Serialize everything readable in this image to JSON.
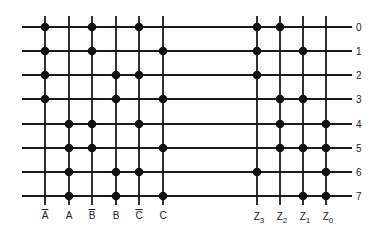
{
  "diagram": {
    "title": "",
    "row_labels": [
      "0",
      "1",
      "2",
      "3",
      "4",
      "5",
      "6",
      "7"
    ],
    "input_columns": [
      {
        "label": "A",
        "complement": true
      },
      {
        "label": "A",
        "complement": false
      },
      {
        "label": "B",
        "complement": true
      },
      {
        "label": "B",
        "complement": false
      },
      {
        "label": "C",
        "complement": true
      },
      {
        "label": "C",
        "complement": false
      }
    ],
    "output_columns": [
      {
        "label": "Z",
        "sub": "3"
      },
      {
        "label": "Z",
        "sub": "2"
      },
      {
        "label": "Z",
        "sub": "1"
      },
      {
        "label": "Z",
        "sub": "0"
      }
    ],
    "connections": {
      "0": {
        "inputs": [
          "A̅",
          "B̅",
          "C̅"
        ],
        "outputs": [
          "Z3",
          "Z2"
        ]
      },
      "1": {
        "inputs": [
          "A̅",
          "B̅",
          "C"
        ],
        "outputs": [
          "Z3",
          "Z1"
        ]
      },
      "2": {
        "inputs": [
          "A̅",
          "B",
          "C̅"
        ],
        "outputs": [
          "Z3"
        ]
      },
      "3": {
        "inputs": [
          "A̅",
          "B",
          "C"
        ],
        "outputs": [
          "Z2",
          "Z1"
        ]
      },
      "4": {
        "inputs": [
          "A",
          "B̅",
          "C̅"
        ],
        "outputs": [
          "Z2",
          "Z0"
        ]
      },
      "5": {
        "inputs": [
          "A",
          "B̅",
          "C"
        ],
        "outputs": [
          "Z2",
          "Z1",
          "Z0"
        ]
      },
      "6": {
        "inputs": [
          "A",
          "B",
          "C̅"
        ],
        "outputs": [
          "Z3",
          "Z0"
        ]
      },
      "7": {
        "inputs": [
          "A",
          "B",
          "C"
        ],
        "outputs": [
          "Z1",
          "Z0"
        ]
      }
    },
    "dot_matrix_inputs": [
      [
        1,
        0,
        1,
        0,
        1,
        0
      ],
      [
        1,
        0,
        1,
        0,
        0,
        1
      ],
      [
        1,
        0,
        0,
        1,
        1,
        0
      ],
      [
        1,
        0,
        0,
        1,
        0,
        1
      ],
      [
        0,
        1,
        1,
        0,
        1,
        0
      ],
      [
        0,
        1,
        1,
        0,
        0,
        1
      ],
      [
        0,
        1,
        0,
        1,
        1,
        0
      ],
      [
        0,
        1,
        0,
        1,
        0,
        1
      ]
    ],
    "dot_matrix_outputs": [
      [
        1,
        1,
        0,
        0
      ],
      [
        1,
        0,
        1,
        0
      ],
      [
        1,
        0,
        0,
        0
      ],
      [
        0,
        1,
        1,
        0
      ],
      [
        0,
        1,
        0,
        1
      ],
      [
        0,
        1,
        1,
        1
      ],
      [
        1,
        0,
        0,
        1
      ],
      [
        0,
        0,
        1,
        1
      ]
    ],
    "colors": {
      "line": "#1a1a1a",
      "dot": "#111111",
      "background": "#ffffff"
    }
  }
}
